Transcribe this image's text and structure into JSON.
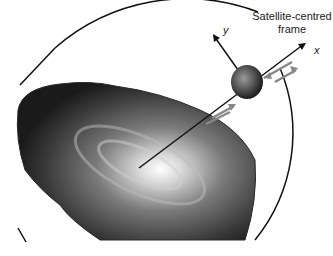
{
  "diagram": {
    "frame_label_line1": "Satellite-centred",
    "frame_label_line2": "frame",
    "axis_x": "x",
    "axis_y": "y",
    "elements": [
      "galaxy-disc",
      "orbit-circle",
      "satellite",
      "radial-line",
      "velocity-arrows"
    ]
  }
}
